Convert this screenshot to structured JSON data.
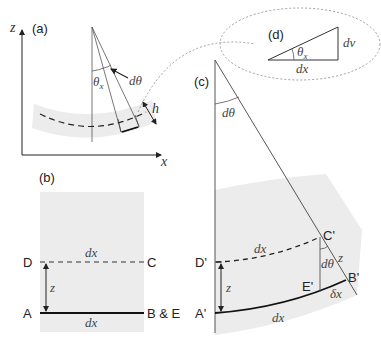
{
  "figure": {
    "panels": {
      "a": {
        "label": "(a)",
        "axis_z": "z",
        "axis_x": "x",
        "angle_label": "θx",
        "angle_sub": "x",
        "angle_main": "θ",
        "dtheta_label": "dθ",
        "thickness_label": "h"
      },
      "b": {
        "label": "(b)",
        "point_D": "D",
        "point_C": "C",
        "point_A": "A",
        "point_BE": "B & E",
        "top_length": "dx",
        "bottom_length": "dx",
        "height": "z"
      },
      "c": {
        "label": "(c)",
        "apex_angle": "dθ",
        "point_C": "C'",
        "point_D": "D'",
        "point_A": "A'",
        "point_B": "B'",
        "point_E": "E'",
        "top_length": "dx",
        "bottom_length": "dx",
        "height": "z",
        "slant_height": "z",
        "inner_angle": "dθ",
        "delta": "δx"
      },
      "d": {
        "label": "(d)",
        "angle_main": "θ",
        "angle_sub": "x",
        "base": "dx",
        "side": "dv"
      }
    },
    "colors": {
      "line": "#333333",
      "band": "#ececec",
      "dashed_connector": "#888888"
    }
  }
}
